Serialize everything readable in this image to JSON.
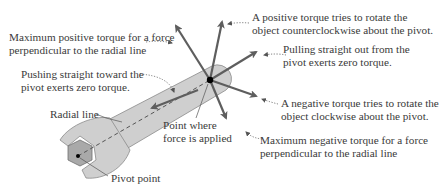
{
  "diagram": {
    "labels": {
      "max_positive": {
        "line1": "Maximum positive torque for a force",
        "line2": "perpendicular to the radial line"
      },
      "positive_torque": {
        "line1": "A positive torque tries to rotate the",
        "line2": "object counterclockwise about the pivot."
      },
      "pulling_out": {
        "line1": "Pulling straight out from the",
        "line2": "pivot exerts zero torque."
      },
      "pushing_toward": {
        "line1": "Pushing straight toward the",
        "line2": "pivot exerts zero torque."
      },
      "negative_torque": {
        "line1": "A negative torque tries to rotate the",
        "line2": "object clockwise about the pivot."
      },
      "max_negative": {
        "line1": "Maximum negative torque for a force",
        "line2": "perpendicular to the radial line"
      },
      "radial_line": "Radial line",
      "point_applied": {
        "line1": "Point where",
        "line2": "force is applied"
      },
      "pivot_point": "Pivot point"
    },
    "colors": {
      "wrench_fill": "#cfcfcf",
      "wrench_stroke": "#8a8a8a",
      "hex_fill": "#a9a9a9",
      "arrow": "#5e5e5e",
      "text": "#3a3a3a",
      "dot": "#000000"
    }
  }
}
